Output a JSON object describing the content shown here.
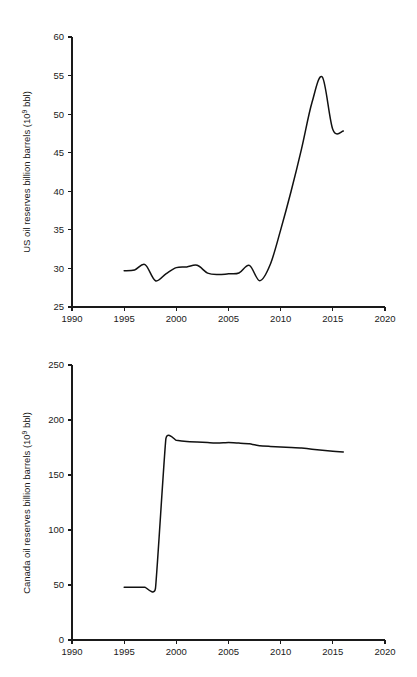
{
  "page": {
    "background": "#ffffff",
    "line_color": "#111111",
    "text_color": "#1a1a1a"
  },
  "chart_data": [
    {
      "id": "us-oil-reserves",
      "type": "line",
      "title": "",
      "xlabel": "",
      "ylabel": "US oil reserves billion barrels (10⁹ bbl)",
      "ylabel_main": "US oil reserves billion barrels (10",
      "ylabel_sup": "9",
      "ylabel_tail": " bbl)",
      "xlim": [
        1990,
        2020
      ],
      "ylim": [
        25,
        60
      ],
      "xticks": [
        1990,
        1995,
        2000,
        2005,
        2010,
        2015,
        2020
      ],
      "yticks": [
        25,
        30,
        35,
        40,
        45,
        50,
        55,
        60
      ],
      "xtick_labels": [
        "1990",
        "1995",
        "2000",
        "2005",
        "2010",
        "2015",
        "2020"
      ],
      "ytick_labels": [
        "25",
        "30",
        "35",
        "40",
        "45",
        "50",
        "55",
        "60"
      ],
      "grid": false,
      "legend": "none",
      "series": [
        {
          "name": "US oil reserves",
          "x": [
            1995,
            1996,
            1997,
            1998,
            1999,
            2000,
            2001,
            2002,
            2003,
            2004,
            2005,
            2006,
            2007,
            2008,
            2009,
            2010,
            2011,
            2012,
            2013,
            2014,
            2015,
            2016
          ],
          "values": [
            29.7,
            29.8,
            30.5,
            28.4,
            29.3,
            30.1,
            30.2,
            30.4,
            29.4,
            29.2,
            29.3,
            29.4,
            30.4,
            28.4,
            30.5,
            35.0,
            40.0,
            45.5,
            51.5,
            54.8,
            48.0,
            47.8
          ]
        }
      ]
    },
    {
      "id": "canada-oil-reserves",
      "type": "line",
      "title": "",
      "xlabel": "",
      "ylabel": "Canada oil reserves billion barrels (10⁹ bbl)",
      "ylabel_main": "Canada oil reserves billion barrels (10",
      "ylabel_sup": "9",
      "ylabel_tail": " bbl)",
      "xlim": [
        1990,
        2020
      ],
      "ylim": [
        0,
        250
      ],
      "xticks": [
        1990,
        1995,
        2000,
        2005,
        2010,
        2015,
        2020
      ],
      "yticks": [
        0,
        50,
        100,
        150,
        200,
        250
      ],
      "xtick_labels": [
        "1990",
        "1995",
        "2000",
        "2005",
        "2010",
        "2015",
        "2020"
      ],
      "ytick_labels": [
        "0",
        "50",
        "100",
        "150",
        "200",
        "250"
      ],
      "grid": false,
      "legend": "none",
      "series": [
        {
          "name": "Canada oil reserves",
          "x": [
            1995,
            1996,
            1997,
            1998,
            1999,
            2000,
            2001,
            2002,
            2003,
            2004,
            2005,
            2006,
            2007,
            2008,
            2009,
            2010,
            2011,
            2012,
            2013,
            2014,
            2015,
            2016
          ],
          "values": [
            48.0,
            48.0,
            48.0,
            47.0,
            183.0,
            181.5,
            180.5,
            180.0,
            179.5,
            179.0,
            179.5,
            179.0,
            178.5,
            176.5,
            176.0,
            175.5,
            175.0,
            174.5,
            173.5,
            172.5,
            171.5,
            171.0
          ]
        }
      ]
    }
  ]
}
